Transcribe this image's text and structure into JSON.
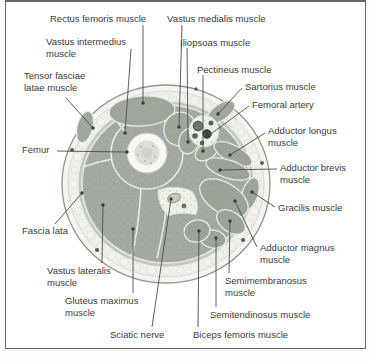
{
  "figure": {
    "kind": "anatomical cross-section diagram of the thigh",
    "colors": {
      "frame_border": "#63676a",
      "label_text": "#3b3b3b",
      "leader_line": "#4d4d4d",
      "skin": "#f3f5f0",
      "fat": "#eef0e9",
      "fascia_band": "#c6ccc1",
      "muscle": "#a4aaa1",
      "septum": "#e9ece3",
      "femur_ring": "#f7f8f4",
      "vessel_dark": "#3e4345",
      "nerve": "#c6ccbd"
    },
    "labels": [
      {
        "id": "rectus-femoris",
        "text": "Rectus femoris muscle",
        "x": 50,
        "y": 13,
        "line": [
          143,
          25,
          143,
          103
        ]
      },
      {
        "id": "vastus-medialis",
        "text": "Vastus medialis muscle",
        "x": 167,
        "y": 13,
        "line": [
          182,
          25,
          179,
          127
        ]
      },
      {
        "id": "vastus-intermedius",
        "text": "Vastus intermedius muscle",
        "x": 46,
        "y": 36,
        "w": 90,
        "line": [
          131,
          49,
          125,
          133
        ]
      },
      {
        "id": "iliopsoas",
        "text": "Iliopsoas muscle",
        "x": 180,
        "y": 37,
        "line": [
          187,
          48,
          188,
          142
        ]
      },
      {
        "id": "tensor-fasciae-latae",
        "text": "Tensor fasciae latae muscle",
        "x": 24,
        "y": 70,
        "w": 68,
        "line": [
          66,
          98,
          93,
          128
        ]
      },
      {
        "id": "pectineus",
        "text": "Pectineus muscle",
        "x": 197,
        "y": 64,
        "line": [
          203,
          75,
          203,
          151
        ]
      },
      {
        "id": "sartorius",
        "text": "Sartorius muscle",
        "x": 245,
        "y": 81,
        "line": [
          242,
          88,
          218,
          114
        ]
      },
      {
        "id": "femoral-artery",
        "text": "Femoral artery",
        "x": 252,
        "y": 99,
        "line": [
          249,
          106,
          208,
          136
        ]
      },
      {
        "id": "adductor-longus",
        "text": "Adductor longus muscle",
        "x": 268,
        "y": 125,
        "w": 80,
        "line": [
          265,
          133,
          230,
          155
        ]
      },
      {
        "id": "adductor-brevis",
        "text": "Adductor brevis muscle",
        "x": 280,
        "y": 162,
        "w": 80,
        "line": [
          277,
          169,
          220,
          170
        ]
      },
      {
        "id": "gracilis",
        "text": "Gracilis muscle",
        "x": 278,
        "y": 202,
        "line": [
          275,
          207,
          252,
          192
        ]
      },
      {
        "id": "adductor-magnus",
        "text": "Adductor magnus muscle",
        "x": 260,
        "y": 242,
        "w": 84,
        "line": [
          257,
          247,
          235,
          201
        ]
      },
      {
        "id": "semimembranosus",
        "text": "Semimembranosus muscle",
        "x": 225,
        "y": 275,
        "w": 86,
        "line": [
          229,
          273,
          230,
          221
        ]
      },
      {
        "id": "semitendinosus",
        "text": "Semitendinosus muscle",
        "x": 210,
        "y": 309,
        "line": [
          216,
          307,
          216,
          238
        ]
      },
      {
        "id": "biceps-femoris",
        "text": "Biceps femoris muscle",
        "x": 193,
        "y": 329,
        "line": [
          198,
          327,
          199,
          231
        ]
      },
      {
        "id": "sciatic-nerve",
        "text": "Sciatic nerve",
        "x": 110,
        "y": 329,
        "line": [
          152,
          327,
          171,
          199
        ]
      },
      {
        "id": "gluteus-maximus",
        "text": "Gluteus maximus muscle",
        "x": 65,
        "y": 295,
        "w": 82,
        "line": [
          133,
          293,
          133,
          229
        ]
      },
      {
        "id": "vastus-lateralis",
        "text": "Vastus lateralis muscle",
        "x": 47,
        "y": 265,
        "w": 76,
        "line": [
          102,
          263,
          103,
          205
        ]
      },
      {
        "id": "fascia-lata",
        "text": "Fascia lata",
        "x": 22,
        "y": 225,
        "line": [
          55,
          224,
          82,
          193
        ]
      },
      {
        "id": "femur",
        "text": "Femur",
        "x": 22,
        "y": 144,
        "line": [
          57,
          151,
          127,
          152
        ]
      }
    ]
  }
}
